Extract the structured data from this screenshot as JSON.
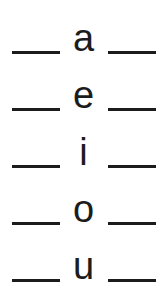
{
  "worksheet": {
    "title": "Vowel fill-in-the-blank worksheet",
    "ink_color": "#1c1c1c",
    "background_color": "#ffffff",
    "rows": [
      {
        "left_blank": "___",
        "letter": "a",
        "right_blank": "___"
      },
      {
        "left_blank": "___",
        "letter": "e",
        "right_blank": "___"
      },
      {
        "left_blank": "___",
        "letter": "i",
        "right_blank": "___"
      },
      {
        "left_blank": "___",
        "letter": "o",
        "right_blank": "___"
      },
      {
        "left_blank": "___",
        "letter": "u",
        "right_blank": "___"
      }
    ]
  }
}
